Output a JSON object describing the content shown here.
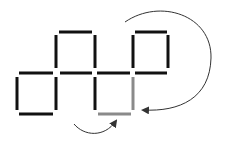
{
  "diagram": {
    "type": "matchstick-puzzle",
    "colors": {
      "match": "#111111",
      "highlighted_match": "#8a8a8a",
      "arrow": "#333333",
      "background": "#ffffff"
    },
    "squares": [
      {
        "id": "bottom-left",
        "row": "bottom",
        "col": 1
      },
      {
        "id": "top-middle-left",
        "row": "top",
        "col": 2
      },
      {
        "id": "bottom-middle-right",
        "row": "bottom",
        "col": 3
      },
      {
        "id": "top-right",
        "row": "top",
        "col": 4
      }
    ],
    "highlighted_matches": [
      "bottom-of-col-3",
      "right-of-col-3-bottom"
    ],
    "arrows": [
      {
        "name": "large-curved-arrow",
        "direction": "clockwise",
        "target": "right-of-col-3-bottom"
      },
      {
        "name": "small-curved-arrow",
        "direction": "counterclockwise",
        "target": "bottom-of-col-3"
      }
    ]
  }
}
